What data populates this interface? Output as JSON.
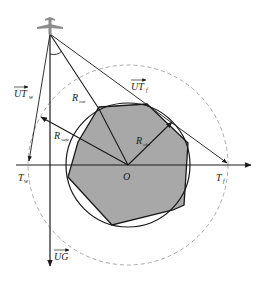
{
  "diagram": {
    "type": "geometry",
    "colors": {
      "line": "#1a1a1a",
      "polygon_fill": "#a8a8a8",
      "dashed_circle": "#aaaaaa",
      "aircraft": "#8c8c8c",
      "background": "#ffffff"
    },
    "labels": {
      "origin": "O",
      "r_out": {
        "main": "R",
        "sub": "out"
      },
      "r_safe": {
        "main": "R",
        "sub": "safe"
      },
      "r_obs": {
        "main": "R",
        "sub": "obs"
      },
      "ut_w": {
        "main": "UT",
        "sub": "w"
      },
      "ut_f": {
        "main": "UT",
        "sub": "f"
      },
      "t_w": {
        "main": "T",
        "sub": "w"
      },
      "t_f": {
        "main": "T",
        "sub": "f"
      },
      "ug": {
        "main": "UG"
      }
    }
  }
}
